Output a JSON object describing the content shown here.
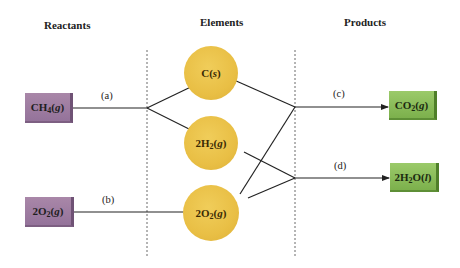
{
  "headers": {
    "reactants": "Reactants",
    "elements": "Elements",
    "products": "Products"
  },
  "reactants": [
    {
      "id": "ch4",
      "main": "CH",
      "sub": "4",
      "state": "g",
      "color": "#9b7aa0"
    },
    {
      "id": "o2",
      "main": "2O",
      "sub": "2",
      "state": "g",
      "color": "#9b7aa0"
    }
  ],
  "elements": [
    {
      "id": "c",
      "main": "C",
      "sub": "",
      "state": "s",
      "color": "#ebc14a"
    },
    {
      "id": "h2",
      "main": "2H",
      "sub": "2",
      "state": "g",
      "color": "#ebc14a"
    },
    {
      "id": "o2",
      "main": "2O",
      "sub": "2",
      "state": "g",
      "color": "#ebc14a"
    }
  ],
  "products": [
    {
      "id": "co2",
      "main": "CO",
      "sub": "2",
      "state": "g",
      "color": "#86b957"
    },
    {
      "id": "h2o",
      "main": "2H",
      "sub": "2",
      "post": "O",
      "state": "l",
      "color": "#86b957"
    }
  ],
  "step_labels": {
    "a": "(a)",
    "b": "(b)",
    "c": "(c)",
    "d": "(d)"
  },
  "paren_open": "(",
  "paren_close": ")"
}
